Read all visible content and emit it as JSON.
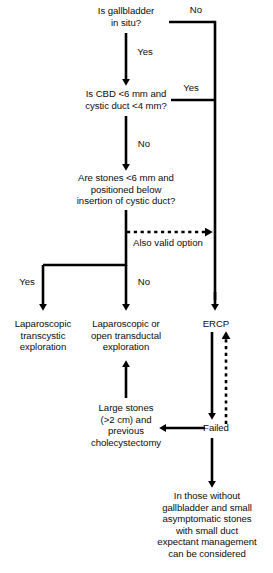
{
  "diagram": {
    "stroke_color": "#000000",
    "text_color": "#0d0d0d",
    "background_color": "#ffffff",
    "nodes": [
      {
        "id": "gallbladder_in_situ",
        "text": "Is gallbladder\nin situ?",
        "type": "decision",
        "x": 126,
        "y": 5,
        "width": 130
      },
      {
        "id": "cbd_size",
        "text": "Is CBD <6 mm and\ncystic duct <4 mm?",
        "type": "decision",
        "x": 126,
        "y": 88,
        "width": 160
      },
      {
        "id": "stones_position",
        "text": "Are stones <6 mm and\npositioned below\ninsertion of cystic duct?",
        "type": "decision",
        "x": 126,
        "y": 172,
        "width": 180
      },
      {
        "id": "lap_transcystic",
        "text": "Laparoscopic\ntranscystic\nexploration",
        "type": "outcome",
        "x": 43,
        "y": 318,
        "width": 100
      },
      {
        "id": "lap_transductal",
        "text": "Laparoscopic or\nopen transductal\nexploration",
        "type": "outcome",
        "x": 126,
        "y": 318,
        "width": 110
      },
      {
        "id": "ercp",
        "text": "ERCP",
        "type": "outcome",
        "x": 216,
        "y": 318,
        "width": 60
      },
      {
        "id": "large_stones",
        "text": "Large stones\n(>2 cm) and\nprevious\ncholecystectomy",
        "type": "condition",
        "x": 126,
        "y": 402,
        "width": 110
      },
      {
        "id": "failed",
        "text": "Failed",
        "type": "status",
        "x": 216,
        "y": 422,
        "width": 50
      },
      {
        "id": "expectant_management",
        "text": "In those without\ngallbladder and small\nasymptomatic stones\nwith small duct\nexpectant management\ncan be considered",
        "type": "outcome",
        "x": 207,
        "y": 490,
        "width": 132
      }
    ],
    "edge_labels": [
      {
        "id": "no_gallbladder",
        "text": "No",
        "x": 196,
        "y": 4
      },
      {
        "id": "yes_cbd",
        "text": "Yes",
        "x": 108,
        "y": 46
      },
      {
        "id": "yes_cbd_small",
        "text": "Yes",
        "x": 187,
        "y": 82
      },
      {
        "id": "no_cbd",
        "text": "No",
        "x": 140,
        "y": 138
      },
      {
        "id": "also_valid_option",
        "text": "Also valid option",
        "x": 126,
        "y": 237
      },
      {
        "id": "yes_stones",
        "text": "Yes",
        "x": 24,
        "y": 276
      },
      {
        "id": "no_stones",
        "text": "No",
        "x": 140,
        "y": 276
      }
    ]
  }
}
